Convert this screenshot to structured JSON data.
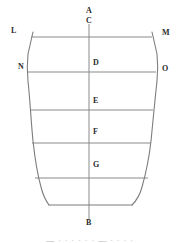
{
  "figure": {
    "background_color": "#ffffff",
    "stroke_color": "#888888",
    "axis_color": "#8a8a8a",
    "label_color": "#2b2b2b",
    "stroke_width": "1",
    "labels": {
      "apex_top_outer": "A",
      "apex_top_inner": "C",
      "rim_left": "L",
      "rim_right": "M",
      "shoulder_left": "N",
      "shoulder_right": "O",
      "level_1": "D",
      "level_2": "E",
      "level_3": "F",
      "level_4": "G",
      "base_bottom": "B"
    },
    "label_positions": [
      {
        "name": "label-a",
        "text": "A",
        "x": 86,
        "y": 11
      },
      {
        "name": "label-c",
        "text": "C",
        "x": 86,
        "y": 21
      },
      {
        "name": "label-l",
        "text": "L",
        "x": 11,
        "y": 30
      },
      {
        "name": "label-m",
        "text": "M",
        "x": 162,
        "y": 32
      },
      {
        "name": "label-n",
        "text": "N",
        "x": 18,
        "y": 65
      },
      {
        "name": "label-o",
        "text": "O",
        "x": 162,
        "y": 67
      },
      {
        "name": "label-d",
        "text": "D",
        "x": 92,
        "y": 62
      },
      {
        "name": "label-e",
        "text": "E",
        "x": 92,
        "y": 100
      },
      {
        "name": "label-f",
        "text": "F",
        "x": 92,
        "y": 130
      },
      {
        "name": "label-g",
        "text": "G",
        "x": 92,
        "y": 163
      },
      {
        "name": "label-b",
        "text": "B",
        "x": 86,
        "y": 222
      }
    ],
    "axis": {
      "name": "vertical-center-axis",
      "x": 89,
      "y_top": 24,
      "y_bottom": 220
    },
    "horizontal_lines": [
      {
        "name": "chord-line-lm",
        "y": 37,
        "x1": 31,
        "x2": 152
      },
      {
        "name": "chord-line-no",
        "y": 72,
        "x1": 27,
        "x2": 156
      },
      {
        "name": "chord-line-e",
        "y": 110,
        "x1": 30,
        "x2": 153
      },
      {
        "name": "chord-line-f",
        "y": 143,
        "x1": 32,
        "x2": 151
      },
      {
        "name": "chord-line-g",
        "y": 178,
        "x1": 35,
        "x2": 148
      },
      {
        "name": "base-line",
        "y": 205,
        "x1": 48,
        "x2": 132
      }
    ],
    "outline": {
      "name": "vessel-outline",
      "left_path": "M 33 32 L 28 52 C 27 62 27 70 28 80 C 30 98 31 120 33 140 C 35 158 37 172 41 186 C 43 194 46 200 49 205",
      "right_path": "M 152 32 L 157 52 C 158 62 158 70 157 80 C 155 98 153 120 151 140 C 149 158 146 172 142 186 C 140 194 136 200 132 205",
      "top_edge": "M 33 32 L 152 32",
      "bottom_edge": "M 49 205 L 132 205"
    },
    "caption_partial": {
      "name": "caption-cropped",
      "text": "— · · ·  · · · — · · · ·",
      "y": 235
    }
  }
}
